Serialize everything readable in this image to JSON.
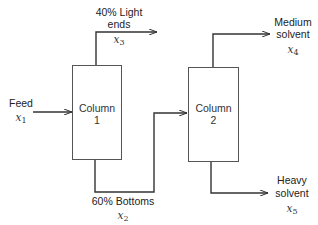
{
  "diagram": {
    "type": "process-flow",
    "colors": {
      "line": "#333333",
      "box_border": "#555555",
      "text": "#222222"
    },
    "columns": [
      {
        "id": "column-1",
        "label": "Column",
        "number": "1"
      },
      {
        "id": "column-2",
        "label": "Column",
        "number": "2"
      }
    ],
    "streams": {
      "feed": {
        "label": "Feed",
        "var": "x",
        "sub": "1"
      },
      "light_ends": {
        "label_line1": "40% Light",
        "label_line2": "ends",
        "var": "x",
        "sub": "3"
      },
      "bottoms": {
        "label": "60% Bottoms",
        "var": "x",
        "sub": "2"
      },
      "medium_solvent": {
        "label_line1": "Medium",
        "label_line2": "solvent",
        "var": "x",
        "sub": "4"
      },
      "heavy_solvent": {
        "label_line1": "Heavy",
        "label_line2": "solvent",
        "var": "x",
        "sub": "5"
      }
    }
  }
}
